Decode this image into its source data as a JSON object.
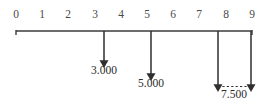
{
  "figure": {
    "type": "cash-flow-timeline",
    "width": 269,
    "height": 104,
    "background_color": "#ffffff",
    "line_color": "#3b3b3b",
    "tick_label_color": "#4a4a4a",
    "flow_label_color": "#2a2a2a"
  },
  "axis": {
    "name": "time-axis",
    "orientation": "horizontal",
    "start_value": 0,
    "end_value": 9,
    "start_px": 16,
    "end_px": 252,
    "y_px": 31,
    "tick_labels": [
      "0",
      "1",
      "2",
      "3",
      "4",
      "5",
      "6",
      "7",
      "8",
      "9"
    ],
    "tick_values": [
      0,
      1,
      2,
      3,
      4,
      5,
      6,
      7,
      8,
      9
    ],
    "tick_x_px": [
      16,
      42,
      68,
      95,
      121,
      147,
      173,
      199,
      226,
      252
    ]
  },
  "flows": [
    {
      "name": "flow-3000",
      "direction": "down",
      "time": 3,
      "x_px": 104,
      "arrow_tip_y_px": 62,
      "label": "3.000",
      "label_x_px": 104,
      "label_y_px": 64
    },
    {
      "name": "flow-5000",
      "direction": "down",
      "time": 5,
      "x_px": 151,
      "arrow_tip_y_px": 75,
      "label": "5.000",
      "label_x_px": 151,
      "label_y_px": 77
    },
    {
      "name": "flow-7500",
      "direction": "down",
      "time_start": 8,
      "time_end": 9,
      "x_start_px": 218,
      "x_end_px": 251,
      "arrow_tip_y_px": 86,
      "connector": "dashed",
      "label": "7.500",
      "label_x_px": 234,
      "label_y_px": 88
    }
  ]
}
